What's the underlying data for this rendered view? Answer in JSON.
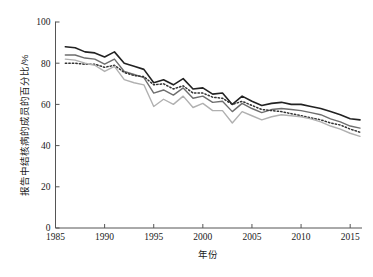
{
  "chart_data": {
    "type": "line",
    "title": "",
    "xlabel": "年份",
    "ylabel": "报告中结核病的成员的百分比/%",
    "xlim": [
      1985,
      2016
    ],
    "ylim": [
      0,
      100
    ],
    "grid": false,
    "legend": "none",
    "xticks": [
      1985,
      1990,
      1995,
      2000,
      2005,
      2010,
      2015
    ],
    "yticks": [
      0,
      20,
      40,
      60,
      80,
      100
    ],
    "x": [
      1986,
      1987,
      1988,
      1989,
      1990,
      1991,
      1992,
      1993,
      1994,
      1995,
      1996,
      1997,
      1998,
      1999,
      2000,
      2001,
      2002,
      2003,
      2004,
      2005,
      2006,
      2007,
      2008,
      2009,
      2010,
      2011,
      2012,
      2013,
      2014,
      2015,
      2016
    ],
    "series": [
      {
        "name": "series-upper-black",
        "style": "solid",
        "color": "#222222",
        "width": 1.6,
        "values": [
          88.0,
          87.5,
          85.5,
          85.0,
          83.0,
          85.5,
          80.0,
          78.5,
          77.0,
          70.5,
          72.0,
          69.5,
          72.5,
          67.5,
          68.0,
          65.0,
          65.5,
          60.0,
          64.0,
          61.5,
          59.5,
          60.5,
          61.0,
          60.0,
          60.0,
          59.0,
          58.0,
          56.5,
          55.0,
          53.0,
          52.5
        ]
      },
      {
        "name": "series-dark-gray",
        "style": "solid",
        "color": "#6e6e6e",
        "width": 1.4,
        "values": [
          84.0,
          84.0,
          82.5,
          82.0,
          79.5,
          82.0,
          76.0,
          74.5,
          73.0,
          65.5,
          67.0,
          64.5,
          68.0,
          63.0,
          64.0,
          61.0,
          61.5,
          56.5,
          60.5,
          58.0,
          56.0,
          57.5,
          58.0,
          57.5,
          57.0,
          56.0,
          55.0,
          53.0,
          51.5,
          49.5,
          48.5
        ]
      },
      {
        "name": "series-dotted",
        "style": "dotted",
        "color": "#333333",
        "width": 1.5,
        "values": [
          80.0,
          80.0,
          79.5,
          79.5,
          78.0,
          79.0,
          75.5,
          74.0,
          73.5,
          69.5,
          70.0,
          67.5,
          69.0,
          65.5,
          65.5,
          63.5,
          63.0,
          60.0,
          61.5,
          59.5,
          57.5,
          57.0,
          56.5,
          55.5,
          54.5,
          53.5,
          52.5,
          51.0,
          50.0,
          48.0,
          46.5
        ]
      },
      {
        "name": "series-light-gray",
        "style": "solid",
        "color": "#b0b0b0",
        "width": 1.4,
        "values": [
          82.0,
          81.5,
          80.0,
          79.0,
          76.0,
          78.5,
          72.0,
          70.5,
          69.5,
          59.0,
          62.5,
          60.0,
          64.0,
          58.5,
          60.5,
          57.0,
          57.0,
          51.0,
          56.5,
          54.5,
          52.5,
          54.0,
          55.0,
          54.5,
          54.0,
          53.0,
          51.5,
          49.5,
          48.0,
          46.0,
          44.5
        ]
      }
    ]
  }
}
